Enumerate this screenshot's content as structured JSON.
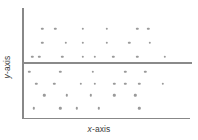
{
  "chart_data": {
    "type": "scatter",
    "title": "",
    "xlabel": "x-axis",
    "ylabel": "y-axis",
    "xlim": [
      0,
      100
    ],
    "ylim": [
      0,
      100
    ],
    "grid": false,
    "legend": false,
    "marker_color": "#9a9a9a",
    "axis_color": "#888888",
    "reference_line": {
      "orientation": "horizontal",
      "y": 54,
      "color": "#8a8a8a"
    },
    "points": [
      {
        "x": 11.9,
        "y": 86.5
      },
      {
        "x": 19.6,
        "y": 86.5
      },
      {
        "x": 35.7,
        "y": 86.5
      },
      {
        "x": 50.0,
        "y": 86.5
      },
      {
        "x": 67.9,
        "y": 86.5
      },
      {
        "x": 74.4,
        "y": 86.5
      },
      {
        "x": 11.9,
        "y": 72.7
      },
      {
        "x": 25.6,
        "y": 72.7
      },
      {
        "x": 35.7,
        "y": 72.7
      },
      {
        "x": 50.0,
        "y": 72.7
      },
      {
        "x": 63.1,
        "y": 72.7
      },
      {
        "x": 75.0,
        "y": 72.7
      },
      {
        "x": 6.0,
        "y": 59.1
      },
      {
        "x": 10.1,
        "y": 59.1
      },
      {
        "x": 23.8,
        "y": 59.1
      },
      {
        "x": 35.7,
        "y": 59.1
      },
      {
        "x": 42.9,
        "y": 59.1
      },
      {
        "x": 53.6,
        "y": 59.1
      },
      {
        "x": 67.9,
        "y": 59.1
      },
      {
        "x": 83.9,
        "y": 59.1
      },
      {
        "x": 4.2,
        "y": 44.5
      },
      {
        "x": 22.6,
        "y": 44.5
      },
      {
        "x": 41.7,
        "y": 44.5
      },
      {
        "x": 60.7,
        "y": 44.5
      },
      {
        "x": 72.6,
        "y": 44.5
      },
      {
        "x": 8.3,
        "y": 32.7
      },
      {
        "x": 19.0,
        "y": 32.7
      },
      {
        "x": 34.5,
        "y": 32.7
      },
      {
        "x": 42.9,
        "y": 32.7
      },
      {
        "x": 54.2,
        "y": 32.7
      },
      {
        "x": 60.7,
        "y": 32.7
      },
      {
        "x": 69.0,
        "y": 32.7
      },
      {
        "x": 82.7,
        "y": 32.7
      },
      {
        "x": 13.1,
        "y": 21.8
      },
      {
        "x": 26.2,
        "y": 21.8
      },
      {
        "x": 40.5,
        "y": 21.8
      },
      {
        "x": 54.2,
        "y": 21.8
      },
      {
        "x": 66.7,
        "y": 21.8
      },
      {
        "x": 7.1,
        "y": 9.1
      },
      {
        "x": 22.6,
        "y": 9.1
      },
      {
        "x": 32.1,
        "y": 9.1
      },
      {
        "x": 45.2,
        "y": 9.1
      },
      {
        "x": 69.0,
        "y": 9.1
      }
    ]
  },
  "labels": {
    "x_axis_var": "x",
    "x_axis_suffix": "-axis",
    "y_axis_var": "y",
    "y_axis_suffix": "-axis"
  }
}
